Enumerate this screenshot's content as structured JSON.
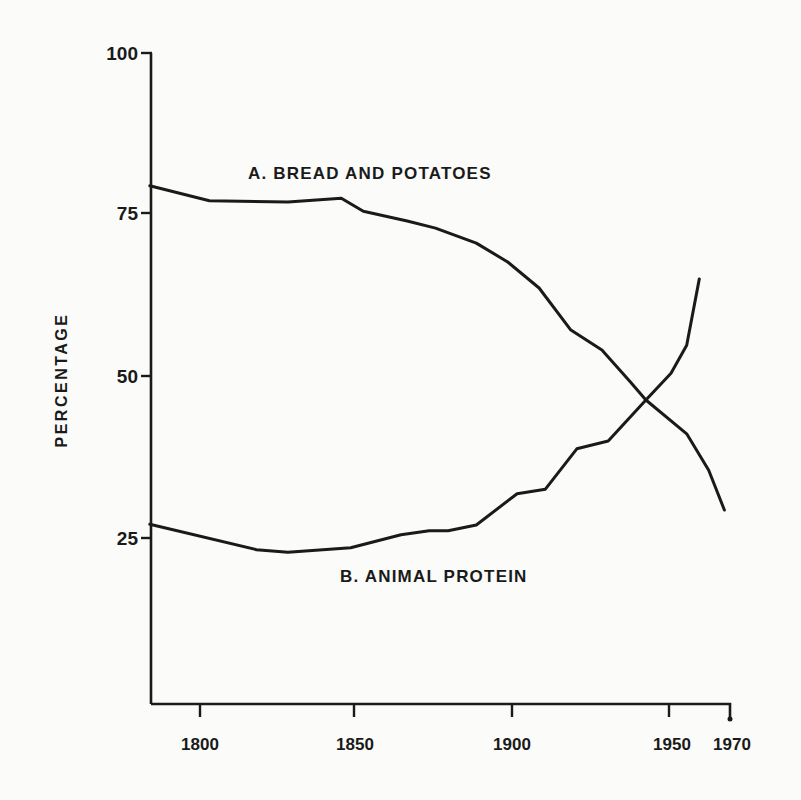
{
  "chart_data": {
    "type": "line",
    "title": "",
    "xlabel": "",
    "ylabel": "PERCENTAGE",
    "xlim": [
      1784,
      1970
    ],
    "ylim": [
      0,
      100
    ],
    "grid": false,
    "legend": "inline labels",
    "x_ticks": [
      1800,
      1850,
      1900,
      1950,
      1970
    ],
    "y_ticks": [
      25,
      50,
      75,
      100
    ],
    "series": [
      {
        "name": "A. BREAD AND POTATOES",
        "x": [
          1784,
          1803,
          1828,
          1845,
          1852,
          1866,
          1875,
          1888,
          1898,
          1908,
          1918,
          1928,
          1937,
          1942,
          1955,
          1962,
          1967
        ],
        "values": [
          79.6,
          77.3,
          77.1,
          77.7,
          75.7,
          74.2,
          73.1,
          70.8,
          67.9,
          63.9,
          57.5,
          54.4,
          49.5,
          46.7,
          41.5,
          35.9,
          29.8
        ]
      },
      {
        "name": "B. ANIMAL PROTEIN",
        "x": [
          1784,
          1818,
          1828,
          1848,
          1864,
          1873,
          1879,
          1888,
          1901,
          1910,
          1920,
          1930,
          1942,
          1950,
          1955,
          1959
        ],
        "values": [
          27.6,
          23.7,
          23.3,
          24.0,
          26.0,
          26.6,
          26.6,
          27.5,
          32.3,
          33.0,
          39.2,
          40.4,
          46.7,
          50.8,
          55.1,
          65.3
        ]
      }
    ]
  },
  "labels": {
    "ylabel": "PERCENTAGE",
    "series_a": "A. BREAD AND POTATOES",
    "series_b": "B. ANIMAL PROTEIN",
    "y_ticks": [
      "100",
      "75",
      "50",
      "25"
    ],
    "x_ticks": [
      "1800",
      "1850",
      "1900",
      "1950",
      "1970"
    ]
  }
}
